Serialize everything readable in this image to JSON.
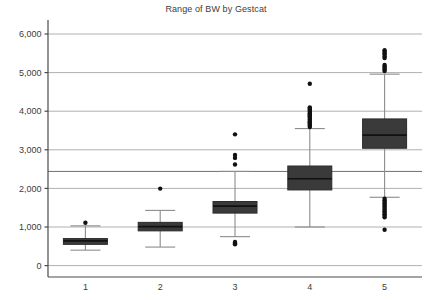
{
  "chart_data": {
    "type": "box",
    "title": "Range of BW by Gestcat",
    "xlabel": "",
    "ylabel": "",
    "categories": [
      "1",
      "2",
      "3",
      "4",
      "5"
    ],
    "ylim": [
      0,
      6200
    ],
    "yticks": [
      0,
      1000,
      2000,
      3000,
      4000,
      5000,
      6000
    ],
    "ytick_labels": [
      "0",
      "1,000",
      "2,000",
      "3,000",
      "4,000",
      "5,000",
      "6,000"
    ],
    "grid": true,
    "legend": "none",
    "reference_line": 2440,
    "box_color": "#3a3a3a",
    "line_color": "#8c8c8c",
    "grid_color": "#b0b0b0",
    "boxes": [
      {
        "category": "1",
        "whisker_low": 400,
        "q1": 550,
        "median": 640,
        "q3": 700,
        "whisker_high": 1030,
        "outliers": [
          1110
        ]
      },
      {
        "category": "2",
        "whisker_low": 480,
        "q1": 900,
        "median": 1010,
        "q3": 1120,
        "whisker_high": 1430,
        "outliers": [
          1995
        ]
      },
      {
        "category": "3",
        "whisker_low": 750,
        "q1": 1360,
        "median": 1540,
        "q3": 1660,
        "whisker_high": 2440,
        "outliers": [
          555,
          570,
          590,
          610,
          2620,
          2790,
          2865,
          3400
        ]
      },
      {
        "category": "4",
        "whisker_low": 1000,
        "q1": 1960,
        "median": 2250,
        "q3": 2580,
        "whisker_high": 3550,
        "outliers": [
          3590,
          3620,
          3650,
          3680,
          3710,
          3740,
          3770,
          3800,
          3830,
          3860,
          3890,
          3920,
          3950,
          3980,
          4010,
          4040,
          4070,
          4100,
          4710
        ]
      },
      {
        "category": "5",
        "whisker_low": 1770,
        "q1": 3040,
        "median": 3380,
        "q3": 3800,
        "whisker_high": 4960,
        "outliers": [
          930,
          1250,
          1290,
          1330,
          1370,
          1410,
          1450,
          1490,
          1530,
          1570,
          1610,
          1650,
          1690,
          1730,
          5040,
          5080,
          5120,
          5160,
          5200,
          5380,
          5420,
          5460,
          5500,
          5540,
          5580
        ]
      }
    ]
  }
}
